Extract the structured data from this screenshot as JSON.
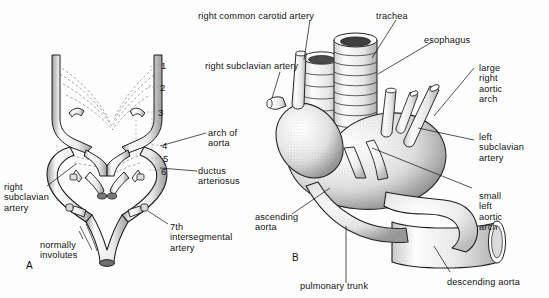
{
  "figure": {
    "background_color": "#fdfdfd",
    "ink_color": "#151515",
    "panels": [
      {
        "id": "A",
        "letter": "A",
        "caption": "Embryonic pharyngeal arch artery pattern"
      },
      {
        "id": "B",
        "letter": "B",
        "caption": "Double aortic arch forming a vascular ring"
      }
    ]
  },
  "panel_a": {
    "letter": "A",
    "arch_numbers": [
      "1",
      "2",
      "3",
      "4",
      "5",
      "6"
    ],
    "labels": {
      "right_subclavian_artery": "right\nsubclavian\nartery",
      "normally_involutes": "normally\ninvolutes",
      "arch_of_aorta": "arch of\naorta",
      "ductus_arteriosus": "ductus\narteriosus",
      "seventh_intersegmental_artery": "7th\nintersegmental\nartery"
    }
  },
  "panel_b": {
    "letter": "B",
    "labels": {
      "right_common_carotid_artery": "right common carotid artery",
      "right_subclavian_artery": "right subclavian artery",
      "trachea": "trachea",
      "esophagus": "esophagus",
      "large_right_aortic_arch": "large\nright\naortic\narch",
      "left_subclavian_artery": "left\nsubclavian\nartery",
      "small_left_aortic_arch": "small\nleft\naortic\narch",
      "ascending_aorta": "ascending\naorta",
      "pulmonary_trunk": "pulmonary trunk",
      "descending_aorta": "descending aorta"
    }
  }
}
